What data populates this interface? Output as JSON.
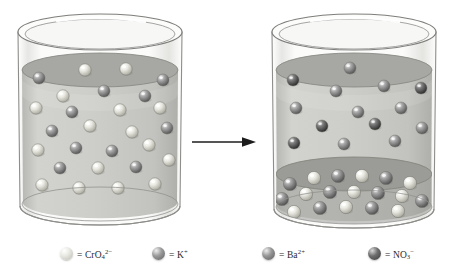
{
  "figure": {
    "type": "chemistry-reaction-diagram",
    "arrow": {
      "name": "reaction-arrow",
      "direction": "right",
      "color": "#1a1a1a"
    }
  },
  "legend": {
    "items": [
      {
        "key": "chromate",
        "equals": "=",
        "label": "CrO",
        "sub": "4",
        "sup": "2−",
        "color": "#e8e8e2",
        "highlight": "#ffffff",
        "shadow": "#b9b9ae",
        "x": 60
      },
      {
        "key": "potassium",
        "equals": "=",
        "label": "K",
        "sub": "",
        "sup": "+",
        "color": "#9a9a9a",
        "highlight": "#efefef",
        "shadow": "#5e5e5e",
        "x": 152
      },
      {
        "key": "barium",
        "equals": "=",
        "label": "Ba",
        "sub": "",
        "sup": "2+",
        "color": "#969696",
        "highlight": "#ededed",
        "shadow": "#5a5a5a",
        "x": 262
      },
      {
        "key": "nitrate",
        "equals": "=",
        "label": "NO",
        "sub": "3",
        "sup": "−",
        "color": "#6e6e6e",
        "highlight": "#d8d8d8",
        "shadow": "#3a3a3a",
        "x": 368
      }
    ]
  },
  "beakers": [
    {
      "name": "left-beaker",
      "side": "left",
      "state": "clear-solution",
      "contents": [
        "chromate",
        "potassium"
      ],
      "glass_color": "#f4f4f2",
      "liquid_color": "#c9c9c6",
      "surface_color": "#a9a9a6",
      "spheres": [
        {
          "t": "potassium",
          "x": 31,
          "y": 70,
          "r": 6.0
        },
        {
          "t": "chromate",
          "x": 77,
          "y": 62,
          "r": 6.2
        },
        {
          "t": "chromate",
          "x": 118,
          "y": 61,
          "r": 6.2
        },
        {
          "t": "potassium",
          "x": 155,
          "y": 72,
          "r": 6.0
        },
        {
          "t": "chromate",
          "x": 55,
          "y": 88,
          "r": 6.2
        },
        {
          "t": "potassium",
          "x": 96,
          "y": 83,
          "r": 6.0
        },
        {
          "t": "potassium",
          "x": 137,
          "y": 88,
          "r": 6.0
        },
        {
          "t": "chromate",
          "x": 28,
          "y": 100,
          "r": 6.2
        },
        {
          "t": "potassium",
          "x": 64,
          "y": 104,
          "r": 6.0
        },
        {
          "t": "chromate",
          "x": 112,
          "y": 102,
          "r": 6.2
        },
        {
          "t": "chromate",
          "x": 152,
          "y": 100,
          "r": 6.2
        },
        {
          "t": "potassium",
          "x": 44,
          "y": 123,
          "r": 6.0
        },
        {
          "t": "chromate",
          "x": 82,
          "y": 118,
          "r": 6.2
        },
        {
          "t": "chromate",
          "x": 124,
          "y": 124,
          "r": 6.2
        },
        {
          "t": "potassium",
          "x": 159,
          "y": 120,
          "r": 6.0
        },
        {
          "t": "chromate",
          "x": 30,
          "y": 142,
          "r": 6.2
        },
        {
          "t": "potassium",
          "x": 68,
          "y": 140,
          "r": 6.0
        },
        {
          "t": "potassium",
          "x": 104,
          "y": 143,
          "r": 6.0
        },
        {
          "t": "chromate",
          "x": 141,
          "y": 137,
          "r": 6.2
        },
        {
          "t": "potassium",
          "x": 52,
          "y": 160,
          "r": 6.0
        },
        {
          "t": "chromate",
          "x": 90,
          "y": 160,
          "r": 6.2
        },
        {
          "t": "potassium",
          "x": 128,
          "y": 159,
          "r": 6.0
        },
        {
          "t": "chromate",
          "x": 161,
          "y": 152,
          "r": 6.2
        },
        {
          "t": "chromate",
          "x": 34,
          "y": 177,
          "r": 6.2
        },
        {
          "t": "chromate",
          "x": 71,
          "y": 180,
          "r": 6.2
        },
        {
          "t": "chromate",
          "x": 110,
          "y": 180,
          "r": 6.2
        },
        {
          "t": "chromate",
          "x": 147,
          "y": 176,
          "r": 6.2
        }
      ]
    },
    {
      "name": "right-beaker",
      "side": "right",
      "state": "with-precipitate",
      "contents": [
        "potassium",
        "nitrate",
        "precipitate"
      ],
      "precipitate_label": "BaCrO4",
      "glass_color": "#f4f4f2",
      "liquid_color": "#c9c9c6",
      "surface_color": "#a9a9a6",
      "spheres": [
        {
          "t": "nitrate",
          "x": 31,
          "y": 72,
          "r": 6.0
        },
        {
          "t": "potassium",
          "x": 88,
          "y": 60,
          "r": 6.0
        },
        {
          "t": "potassium",
          "x": 74,
          "y": 83,
          "r": 6.0
        },
        {
          "t": "potassium",
          "x": 122,
          "y": 78,
          "r": 6.0
        },
        {
          "t": "nitrate",
          "x": 159,
          "y": 80,
          "r": 6.0
        },
        {
          "t": "potassium",
          "x": 34,
          "y": 100,
          "r": 6.0
        },
        {
          "t": "potassium",
          "x": 96,
          "y": 104,
          "r": 6.0
        },
        {
          "t": "potassium",
          "x": 139,
          "y": 100,
          "r": 6.0
        },
        {
          "t": "nitrate",
          "x": 60,
          "y": 118,
          "r": 6.0
        },
        {
          "t": "nitrate",
          "x": 113,
          "y": 116,
          "r": 6.0
        },
        {
          "t": "potassium",
          "x": 160,
          "y": 120,
          "r": 6.0
        },
        {
          "t": "nitrate",
          "x": 32,
          "y": 135,
          "r": 6.0
        },
        {
          "t": "potassium",
          "x": 82,
          "y": 136,
          "r": 6.0
        },
        {
          "t": "potassium",
          "x": 133,
          "y": 133,
          "r": 6.0
        }
      ],
      "precipitate": [
        {
          "t": "barium",
          "x": 28,
          "y": 176,
          "r": 6.6
        },
        {
          "t": "chromate",
          "x": 52,
          "y": 170,
          "r": 6.6
        },
        {
          "t": "barium",
          "x": 76,
          "y": 168,
          "r": 6.6
        },
        {
          "t": "chromate",
          "x": 100,
          "y": 168,
          "r": 6.6
        },
        {
          "t": "barium",
          "x": 124,
          "y": 170,
          "r": 6.6
        },
        {
          "t": "chromate",
          "x": 148,
          "y": 175,
          "r": 6.6
        },
        {
          "t": "barium",
          "x": 20,
          "y": 191,
          "r": 6.6
        },
        {
          "t": "chromate",
          "x": 44,
          "y": 186,
          "r": 6.6
        },
        {
          "t": "barium",
          "x": 68,
          "y": 184,
          "r": 6.6
        },
        {
          "t": "chromate",
          "x": 92,
          "y": 184,
          "r": 6.6
        },
        {
          "t": "barium",
          "x": 116,
          "y": 185,
          "r": 6.6
        },
        {
          "t": "chromate",
          "x": 140,
          "y": 188,
          "r": 6.6
        },
        {
          "t": "barium",
          "x": 160,
          "y": 193,
          "r": 6.6
        },
        {
          "t": "chromate",
          "x": 32,
          "y": 204,
          "r": 6.6
        },
        {
          "t": "barium",
          "x": 58,
          "y": 200,
          "r": 6.6
        },
        {
          "t": "chromate",
          "x": 84,
          "y": 199,
          "r": 6.6
        },
        {
          "t": "barium",
          "x": 110,
          "y": 200,
          "r": 6.6
        },
        {
          "t": "chromate",
          "x": 136,
          "y": 203,
          "r": 6.6
        }
      ]
    }
  ],
  "sphere_styles": {
    "chromate": {
      "base": "#e4e4dd",
      "light": "#ffffff",
      "dark": "#b0b0a6"
    },
    "potassium": {
      "base": "#9d9d9d",
      "light": "#f2f2f2",
      "dark": "#5d5d5d"
    },
    "barium": {
      "base": "#9a9a9a",
      "light": "#efefef",
      "dark": "#5a5a5a"
    },
    "nitrate": {
      "base": "#6f6f6f",
      "light": "#d6d6d6",
      "dark": "#353535"
    }
  }
}
